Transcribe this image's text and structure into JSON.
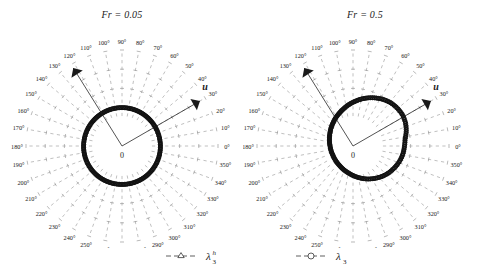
{
  "figure": {
    "background": "#ffffff",
    "ink": "#1a1a1a",
    "grid_color": "#8c8c8c",
    "marker_color": "#111111"
  },
  "panels": [
    {
      "id": "panel-left",
      "title": "Fr = 0.05",
      "fr_value": "0.05",
      "origin_label": "0",
      "flow_arrow_label": "u",
      "flow_arrow_angle_deg": 30,
      "secondary_arrow_angle_deg": 122,
      "secondary_arrow_label": "",
      "ring_shape": "circular"
    },
    {
      "id": "panel-right",
      "title": "Fr = 0.5",
      "fr_value": "0.5",
      "origin_label": "0",
      "flow_arrow_label": "u",
      "flow_arrow_angle_deg": 30,
      "secondary_arrow_angle_deg": 122,
      "secondary_arrow_label": "",
      "ring_shape": "offset"
    }
  ],
  "angle_labels": [
    "0°",
    "10°",
    "20°",
    "30°",
    "40°",
    "50°",
    "60°",
    "70°",
    "80°",
    "90°",
    "100°",
    "110°",
    "120°",
    "130°",
    "140°",
    "150°",
    "160°",
    "170°",
    "180°",
    "190°",
    "200°",
    "210°",
    "220°",
    "230°",
    "240°",
    "250°",
    "260°",
    "270°",
    "280°",
    "290°",
    "300°",
    "310°",
    "320°",
    "330°",
    "340°",
    "350°"
  ],
  "legend": {
    "entries": [
      {
        "marker": "triangle-marker",
        "label": "λ",
        "sub": "3",
        "sup": "h"
      },
      {
        "marker": "circle-marker",
        "label": "λ",
        "sub": "3",
        "sup": ""
      }
    ]
  },
  "chart_data": {
    "type": "polar",
    "angular_unit": "degrees",
    "angular_range": [
      0,
      360
    ],
    "angular_tick_step": 10,
    "grid": true,
    "grid_style": "dashed radial spokes with radial tick marks",
    "legend_position": "bottom-center",
    "series": [
      {
        "name": "λ3^h",
        "marker": "triangle",
        "panel": "Fr = 0.05",
        "description": "dense triangle markers tracing an almost perfectly circular locus of constant radius",
        "theta": [
          0,
          10,
          20,
          30,
          40,
          50,
          60,
          70,
          80,
          90,
          100,
          110,
          120,
          130,
          140,
          150,
          160,
          170,
          180,
          190,
          200,
          210,
          220,
          230,
          240,
          250,
          260,
          270,
          280,
          290,
          300,
          310,
          320,
          330,
          340,
          350
        ],
        "r": [
          1.0,
          1.0,
          1.0,
          1.0,
          1.0,
          1.0,
          1.0,
          1.0,
          1.0,
          1.0,
          1.0,
          1.0,
          1.0,
          1.0,
          1.0,
          1.0,
          1.0,
          1.0,
          1.0,
          1.0,
          1.0,
          1.0,
          1.0,
          1.0,
          1.0,
          1.0,
          1.0,
          1.0,
          1.0,
          1.0,
          1.0,
          1.0,
          1.0,
          1.0,
          1.0,
          1.0
        ]
      },
      {
        "name": "λ3",
        "marker": "circle",
        "panel": "Fr = 0.05",
        "description": "circle markers coincident with the triangle locus, forming a single thick black ring",
        "theta": [
          0,
          10,
          20,
          30,
          40,
          50,
          60,
          70,
          80,
          90,
          100,
          110,
          120,
          130,
          140,
          150,
          160,
          170,
          180,
          190,
          200,
          210,
          220,
          230,
          240,
          250,
          260,
          270,
          280,
          290,
          300,
          310,
          320,
          330,
          340,
          350
        ],
        "r": [
          1.0,
          1.0,
          1.0,
          1.0,
          1.0,
          1.0,
          1.0,
          1.0,
          1.0,
          1.0,
          1.0,
          1.0,
          1.0,
          1.0,
          1.0,
          1.0,
          1.0,
          1.0,
          1.0,
          1.0,
          1.0,
          1.0,
          1.0,
          1.0,
          1.0,
          1.0,
          1.0,
          1.0,
          1.0,
          1.0,
          1.0,
          1.0,
          1.0,
          1.0,
          1.0,
          1.0
        ]
      },
      {
        "name": "λ3^h",
        "marker": "triangle",
        "panel": "Fr = 0.5",
        "description": "locus displaced toward the 30–40° direction, larger radius on the upper-right side and smaller toward 210°",
        "theta": [
          0,
          10,
          20,
          30,
          40,
          50,
          60,
          70,
          80,
          90,
          100,
          110,
          120,
          130,
          140,
          150,
          160,
          170,
          180,
          190,
          200,
          210,
          220,
          230,
          240,
          250,
          260,
          270,
          280,
          290,
          300,
          310,
          320,
          330,
          340,
          350
        ],
        "r": [
          1.17,
          1.22,
          1.26,
          1.28,
          1.27,
          1.25,
          1.21,
          1.16,
          1.11,
          1.06,
          1.01,
          0.97,
          0.93,
          0.9,
          0.88,
          0.86,
          0.85,
          0.84,
          0.84,
          0.84,
          0.85,
          0.86,
          0.88,
          0.9,
          0.93,
          0.96,
          1.0,
          1.04,
          1.08,
          1.11,
          1.14,
          1.16,
          1.17,
          1.18,
          1.18,
          1.17
        ]
      },
      {
        "name": "λ3",
        "marker": "circle",
        "panel": "Fr = 0.5",
        "description": "circle markers overlapping the triangle locus, tracing the same offset ring",
        "theta": [
          0,
          10,
          20,
          30,
          40,
          50,
          60,
          70,
          80,
          90,
          100,
          110,
          120,
          130,
          140,
          150,
          160,
          170,
          180,
          190,
          200,
          210,
          220,
          230,
          240,
          250,
          260,
          270,
          280,
          290,
          300,
          310,
          320,
          330,
          340,
          350
        ],
        "r": [
          1.17,
          1.22,
          1.26,
          1.28,
          1.27,
          1.25,
          1.21,
          1.16,
          1.11,
          1.06,
          1.01,
          0.97,
          0.93,
          0.9,
          0.88,
          0.86,
          0.85,
          0.84,
          0.84,
          0.84,
          0.85,
          0.86,
          0.88,
          0.9,
          0.93,
          0.96,
          1.0,
          1.04,
          1.08,
          1.11,
          1.14,
          1.16,
          1.17,
          1.18,
          1.18,
          1.17
        ]
      }
    ],
    "annotations": [
      {
        "text": "u",
        "panel": "Fr = 0.05",
        "angle_deg": 30,
        "style": "bold italic, arrow pointing outward"
      },
      {
        "text": "u",
        "panel": "Fr = 0.5",
        "angle_deg": 30,
        "style": "bold italic, arrow pointing outward"
      },
      {
        "text": "",
        "panel": "Fr = 0.05",
        "angle_deg": 122,
        "style": "unlabeled arrow pointing outward"
      },
      {
        "text": "",
        "panel": "Fr = 0.5",
        "angle_deg": 122,
        "style": "unlabeled arrow pointing outward"
      },
      {
        "text": "0",
        "panel": "both",
        "position": "origin"
      }
    ]
  }
}
